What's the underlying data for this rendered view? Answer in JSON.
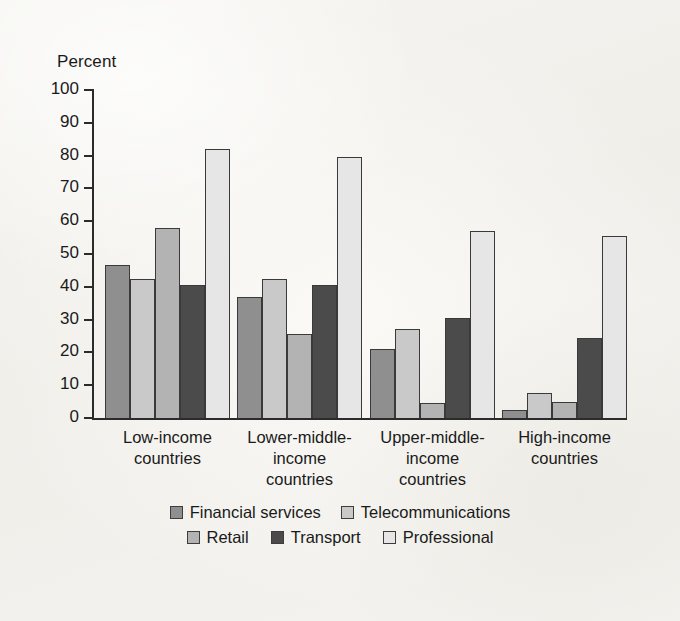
{
  "axis": {
    "y_title": "Percent",
    "y_ticks": [
      "100",
      "90",
      "80",
      "70",
      "60",
      "50",
      "40",
      "30",
      "20",
      "10",
      "0"
    ]
  },
  "categories_display": [
    "Low-income\ncountries",
    "Lower-middle-\nincome\ncountries",
    "Upper-middle-\nincome\ncountries",
    "High-income\ncountries"
  ],
  "legend": {
    "row1": [
      {
        "label": "Financial services",
        "swatch": "#8f8f8f"
      },
      {
        "label": "Telecommunications",
        "swatch": "#c9c9c9"
      }
    ],
    "row2": [
      {
        "label": "Retail",
        "swatch": "#b3b3b3"
      },
      {
        "label": "Transport",
        "swatch": "#4b4b4b"
      },
      {
        "label": "Professional",
        "swatch": "#e6e6e6"
      }
    ]
  },
  "chart_data": {
    "type": "bar",
    "title": "",
    "xlabel": "",
    "ylabel": "Percent",
    "ylim": [
      0,
      100
    ],
    "ytick_step": 10,
    "grid": false,
    "legend_position": "bottom",
    "categories": [
      "Low-income countries",
      "Lower-middle-income countries",
      "Upper-middle-income countries",
      "High-income countries"
    ],
    "series": [
      {
        "name": "Financial services",
        "color": "#8f8f8f",
        "values": [
          46.5,
          37.0,
          21.0,
          2.5
        ]
      },
      {
        "name": "Telecommunications",
        "color": "#c9c9c9",
        "values": [
          42.5,
          42.5,
          27.0,
          7.5
        ]
      },
      {
        "name": "Retail",
        "color": "#b3b3b3",
        "values": [
          58.0,
          25.5,
          4.5,
          4.8
        ]
      },
      {
        "name": "Transport",
        "color": "#4b4b4b",
        "values": [
          40.5,
          40.5,
          30.5,
          24.3
        ]
      },
      {
        "name": "Professional",
        "color": "#e6e6e6",
        "values": [
          82.0,
          79.5,
          57.0,
          55.5
        ]
      }
    ]
  }
}
